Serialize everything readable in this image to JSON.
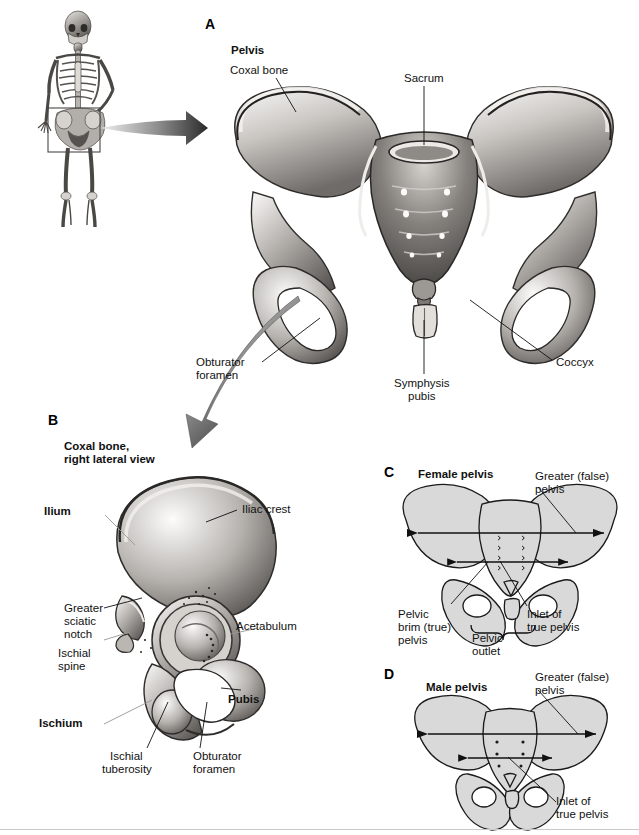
{
  "figure": {
    "background_color": "#ffffff",
    "text_color": "#111111",
    "panel_count": 4
  },
  "panels": [
    {
      "id": "A",
      "letter": "A",
      "heading": "Pelvis",
      "subject": "anterior view of bony pelvis",
      "labels": [
        {
          "text": "Coxal bone",
          "style": "plain"
        },
        {
          "text": "Sacrum",
          "style": "plain"
        },
        {
          "text": "Coccyx",
          "style": "plain"
        },
        {
          "text": "Obturator\nforamen",
          "style": "plain"
        },
        {
          "text": "Symphysis\npubis",
          "style": "plain"
        }
      ]
    },
    {
      "id": "B",
      "letter": "B",
      "heading": "Coxal bone,\nright lateral view",
      "subject": "right coxal (hip) bone, lateral view",
      "labels": [
        {
          "text": "Ilium",
          "style": "bold"
        },
        {
          "text": "Iliac crest",
          "style": "plain"
        },
        {
          "text": "Greater\nsciatic\nnotch",
          "style": "plain"
        },
        {
          "text": "Ischial\nspine",
          "style": "plain"
        },
        {
          "text": "Acetabulum",
          "style": "plain"
        },
        {
          "text": "Ischium",
          "style": "bold"
        },
        {
          "text": "Pubis",
          "style": "bold"
        },
        {
          "text": "Ischial\ntuberosity",
          "style": "plain"
        },
        {
          "text": "Obturator\nforamen",
          "style": "plain"
        }
      ]
    },
    {
      "id": "C",
      "letter": "C",
      "heading": "Female pelvis",
      "subject": "female pelvis schematic with measurement arrows",
      "labels": [
        {
          "text": "Greater (false)\npelvis",
          "style": "plain"
        },
        {
          "text": "Inlet of\ntrue pelvis",
          "style": "plain"
        },
        {
          "text": "Pelvic\nbrim (true)\npelvis",
          "style": "plain"
        },
        {
          "text": "Pelvic\noutlet",
          "style": "plain"
        }
      ]
    },
    {
      "id": "D",
      "letter": "D",
      "heading": "Male pelvis",
      "subject": "male pelvis schematic with measurement arrows",
      "labels": [
        {
          "text": "Greater (false)\npelvis",
          "style": "plain"
        },
        {
          "text": "Inlet of\ntrue pelvis",
          "style": "plain"
        }
      ]
    }
  ],
  "orientation_figure": {
    "name": "full skeleton with pelvis highlighted",
    "highlight_box": true,
    "arrow_direction": "right"
  },
  "panel_labels": {
    "a": "A",
    "b": "B",
    "c": "C",
    "d": "D"
  },
  "a_labels": {
    "pelvis": "Pelvis",
    "coxal_bone": "Coxal bone",
    "sacrum": "Sacrum",
    "coccyx": "Coccyx",
    "obturator_foramen_l1": "Obturator",
    "obturator_foramen_l2": "foramen",
    "symphysis_pubis_l1": "Symphysis",
    "symphysis_pubis_l2": "pubis"
  },
  "b_labels": {
    "heading_l1": "Coxal bone,",
    "heading_l2": "right lateral view",
    "ilium": "Ilium",
    "iliac_crest": "Iliac crest",
    "greater_sciatic_l1": "Greater",
    "greater_sciatic_l2": "sciatic",
    "greater_sciatic_l3": "notch",
    "ischial_spine_l1": "Ischial",
    "ischial_spine_l2": "spine",
    "acetabulum": "Acetabulum",
    "ischium": "Ischium",
    "pubis": "Pubis",
    "ischial_tuberosity_l1": "Ischial",
    "ischial_tuberosity_l2": "tuberosity",
    "obturator_foramen_l1": "Obturator",
    "obturator_foramen_l2": "foramen"
  },
  "c_labels": {
    "heading": "Female pelvis",
    "greater_false_l1": "Greater (false)",
    "greater_false_l2": "pelvis",
    "inlet_l1": "Inlet of",
    "inlet_l2": "true pelvis",
    "pelvic_brim_l1": "Pelvic",
    "pelvic_brim_l2": "brim (true)",
    "pelvic_brim_l3": "pelvis",
    "pelvic_outlet_l1": "Pelvic",
    "pelvic_outlet_l2": "outlet"
  },
  "d_labels": {
    "heading": "Male pelvis",
    "greater_false_l1": "Greater (false)",
    "greater_false_l2": "pelvis",
    "inlet_l1": "Inlet of",
    "inlet_l2": "true pelvis"
  },
  "colors": {
    "bone_light": "#f2f0ee",
    "bone_mid": "#b9b6b2",
    "bone_dark": "#6d6a67",
    "bone_shadow": "#3a3836",
    "schematic_fill": "#d9d9d9",
    "schematic_stroke": "#1a1a1a",
    "leader_line": "#1a1a1a",
    "rule": "#c9c9c9"
  }
}
